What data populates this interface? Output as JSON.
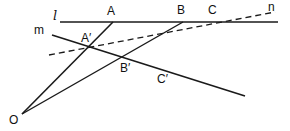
{
  "diagram": {
    "title": "",
    "stroke_color": "#1a1a1a",
    "background": "#ffffff",
    "points": {
      "O": {
        "label": "O",
        "x": 22,
        "y": 114
      },
      "A": {
        "label": "A",
        "x": 113,
        "y": 22
      },
      "B": {
        "label": "B",
        "x": 183,
        "y": 22
      },
      "C": {
        "label": "C",
        "x": 213,
        "y": 22
      },
      "A_prime": {
        "label": "A′",
        "x": 88,
        "y": 47
      },
      "B_prime": {
        "label": "B′",
        "x": 128,
        "y": 58
      },
      "C_prime": {
        "label": "C′",
        "x": 160,
        "y": 69
      }
    },
    "lines": {
      "l": {
        "label": "l",
        "style": "solid",
        "from": [
          60,
          22
        ],
        "to": [
          278,
          22
        ]
      },
      "m": {
        "label": "m",
        "style": "solid",
        "from": [
          52,
          35
        ],
        "to": [
          245,
          96
        ]
      },
      "n": {
        "label": "n",
        "style": "dashed",
        "from": [
          49,
          55
        ],
        "to": [
          275,
          12
        ]
      },
      "OA": {
        "label": "",
        "style": "solid",
        "from": [
          22,
          114
        ],
        "to": [
          113,
          22
        ]
      },
      "OB": {
        "label": "",
        "style": "solid",
        "from": [
          22,
          114
        ],
        "to": [
          183,
          22
        ]
      }
    },
    "labels": {
      "l": "l",
      "m": "m",
      "n": "n",
      "O": "O",
      "A": "A",
      "B": "B",
      "C": "C",
      "A_prime": "A′",
      "B_prime": "B′",
      "C_prime": "C′"
    }
  }
}
